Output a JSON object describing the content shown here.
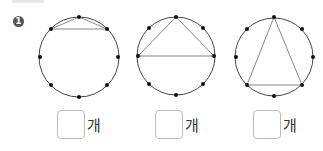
{
  "problem": {
    "number": "1",
    "unit": "개"
  },
  "figures": [
    {
      "name": "circle-1",
      "center": [
        79,
        57
      ],
      "radius": 40,
      "points": [
        [
          79,
          17
        ],
        [
          107,
          29
        ],
        [
          118,
          57
        ],
        [
          107,
          85
        ],
        [
          79,
          97
        ],
        [
          51,
          85
        ],
        [
          40,
          57
        ],
        [
          51,
          29
        ]
      ],
      "lines": [
        [
          [
            51,
            29
          ],
          [
            79,
            17
          ]
        ],
        [
          [
            79,
            17
          ],
          [
            107,
            29
          ]
        ],
        [
          [
            51,
            29
          ],
          [
            107,
            29
          ]
        ]
      ]
    },
    {
      "name": "circle-2",
      "center": [
        176,
        56
      ],
      "radius": 39,
      "points": [
        [
          176,
          17
        ],
        [
          203,
          28
        ],
        [
          214,
          56
        ],
        [
          203,
          84
        ],
        [
          176,
          95
        ],
        [
          149,
          84
        ],
        [
          138,
          56
        ],
        [
          149,
          28
        ]
      ],
      "lines": [
        [
          [
            176,
            17
          ],
          [
            138,
            56
          ]
        ],
        [
          [
            176,
            17
          ],
          [
            214,
            56
          ]
        ],
        [
          [
            138,
            56
          ],
          [
            214,
            56
          ]
        ]
      ]
    },
    {
      "name": "circle-3",
      "center": [
        274,
        57
      ],
      "radius": 39,
      "points": [
        [
          274,
          17
        ],
        [
          302,
          29
        ],
        [
          313,
          57
        ],
        [
          302,
          85
        ],
        [
          274,
          96
        ],
        [
          247,
          85
        ],
        [
          236,
          57
        ],
        [
          247,
          29
        ]
      ],
      "lines": [
        [
          [
            274,
            17
          ],
          [
            247,
            85
          ]
        ],
        [
          [
            274,
            17
          ],
          [
            302,
            85
          ]
        ],
        [
          [
            247,
            85
          ],
          [
            302,
            85
          ]
        ]
      ]
    }
  ],
  "answers": [
    {
      "value": "",
      "left": 57
    },
    {
      "value": "",
      "left": 155
    },
    {
      "value": "",
      "left": 253
    }
  ],
  "colors": {
    "circle": "#444444",
    "chord": "#888888",
    "dot": "#111111",
    "box_border": "#bdbdbd"
  }
}
